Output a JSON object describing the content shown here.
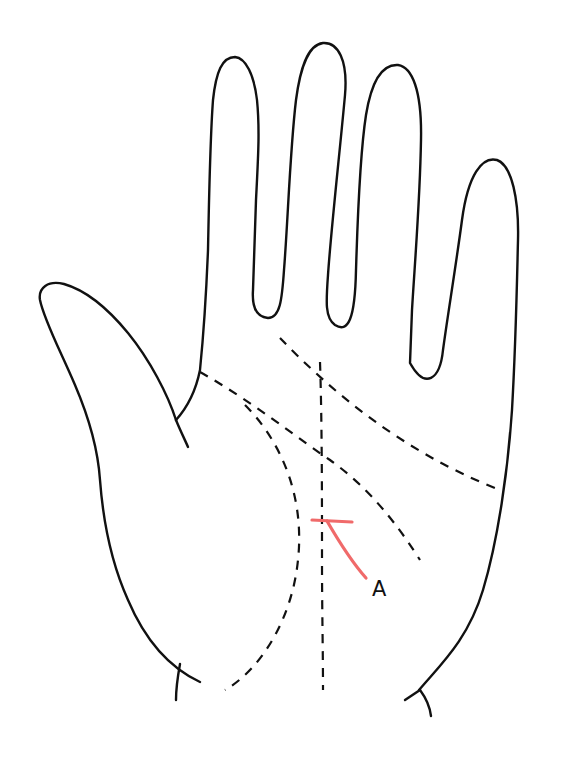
{
  "diagram": {
    "annotation": {
      "label": "A",
      "marker_color": "#f06a6a"
    },
    "lines": [
      {
        "name": "heart-line",
        "style": "dashed"
      },
      {
        "name": "head-line",
        "style": "dashed"
      },
      {
        "name": "life-line",
        "style": "dashed"
      },
      {
        "name": "fate-line",
        "style": "dashed"
      },
      {
        "name": "finger-crease-line",
        "style": "dashed"
      }
    ],
    "colors": {
      "outline": "#111111",
      "marker": "#f06a6a",
      "background": "#ffffff"
    }
  }
}
